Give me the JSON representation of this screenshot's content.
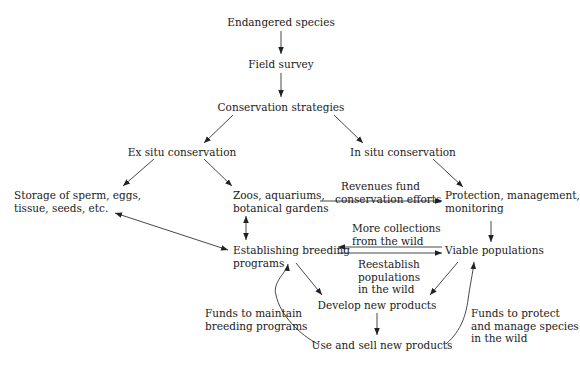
{
  "diagram": {
    "type": "flowchart",
    "nodes": {
      "endangered": "Endangered species",
      "survey": "Field survey",
      "strategies": "Conservation strategies",
      "exsitu": "Ex situ conservation",
      "insitu": "In situ conservation",
      "storage": [
        "Storage of sperm, eggs,",
        "tissue, seeds, etc."
      ],
      "zoos": [
        "Zoos, aquariums,",
        "botanical gardens"
      ],
      "protection": [
        "Protection, management,",
        "monitoring"
      ],
      "breeding": [
        "Establishing breeding",
        "programs"
      ],
      "viable": "Viable populations",
      "develop": "Develop new products",
      "use": "Use and sell new products"
    },
    "edge_labels": {
      "revenues": [
        "Revenues fund",
        "conservation efforts"
      ],
      "more_collections": [
        "More collections",
        "from the wild"
      ],
      "reestablish": [
        "Reestablish",
        "populations",
        "in the wild"
      ],
      "funds_breeding": [
        "Funds to maintain",
        "breeding programs"
      ],
      "funds_protect": [
        "Funds to protect",
        "and manage species",
        "in the wild"
      ]
    },
    "edges": [
      {
        "from": "Endangered species",
        "to": "Field survey"
      },
      {
        "from": "Field survey",
        "to": "Conservation strategies"
      },
      {
        "from": "Conservation strategies",
        "to": "Ex situ conservation"
      },
      {
        "from": "Conservation strategies",
        "to": "In situ conservation"
      },
      {
        "from": "Ex situ conservation",
        "to": "Storage of sperm, eggs, tissue, seeds, etc."
      },
      {
        "from": "Ex situ conservation",
        "to": "Zoos, aquariums, botanical gardens"
      },
      {
        "from": "In situ conservation",
        "to": "Protection, management, monitoring"
      },
      {
        "from": "Zoos, aquariums, botanical gardens",
        "to": "Protection, management, monitoring",
        "label": "Revenues fund conservation efforts"
      },
      {
        "from": "Storage of sperm, eggs, tissue, seeds, etc.",
        "to": "Establishing breeding programs",
        "bidirectional": true
      },
      {
        "from": "Zoos, aquariums, botanical gardens",
        "to": "Establishing breeding programs",
        "bidirectional": true
      },
      {
        "from": "Protection, management, monitoring",
        "to": "Viable populations"
      },
      {
        "from": "Viable populations",
        "to": "Establishing breeding programs",
        "label": "More collections from the wild"
      },
      {
        "from": "Establishing breeding programs",
        "to": "Viable populations",
        "label": "Reestablish populations in the wild"
      },
      {
        "from": "Establishing breeding programs",
        "to": "Develop new products"
      },
      {
        "from": "Viable populations",
        "to": "Develop new products"
      },
      {
        "from": "Develop new products",
        "to": "Use and sell new products"
      },
      {
        "from": "Use and sell new products",
        "to": "Establishing breeding programs",
        "label": "Funds to maintain breeding programs"
      },
      {
        "from": "Use and sell new products",
        "to": "Viable populations",
        "label": "Funds to protect and manage species in the wild"
      }
    ],
    "colors": {
      "text": "#1a1a1a",
      "line": "#333333"
    }
  }
}
